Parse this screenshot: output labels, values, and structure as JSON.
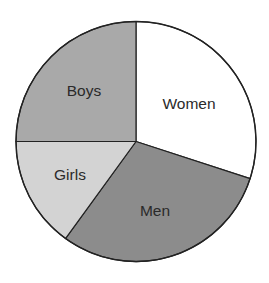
{
  "chart_data": {
    "type": "pie",
    "title": "",
    "categories": [
      "Women",
      "Men",
      "Girls",
      "Boys"
    ],
    "values": [
      30,
      30,
      15,
      25
    ],
    "colors": [
      "#ffffff",
      "#8c8c8c",
      "#d3d3d3",
      "#a9a9a9"
    ],
    "start_angle_deg": 0,
    "direction": "clockwise",
    "legend": "none",
    "labels_inside": true
  },
  "slices": [
    {
      "label": "Women",
      "value": 30,
      "color": "#ffffff",
      "lx": 189,
      "ly": 109
    },
    {
      "label": "Men",
      "value": 30,
      "color": "#8c8c8c",
      "lx": 155,
      "ly": 216
    },
    {
      "label": "Girls",
      "value": 15,
      "color": "#d3d3d3",
      "lx": 70,
      "ly": 180
    },
    {
      "label": "Boys",
      "value": 25,
      "color": "#a9a9a9",
      "lx": 84,
      "ly": 96
    }
  ],
  "geometry": {
    "cx": 136,
    "cy": 141.5,
    "r": 120
  }
}
